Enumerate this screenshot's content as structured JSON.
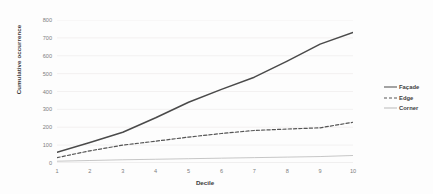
{
  "chart_data": {
    "type": "line",
    "title": "",
    "xlabel": "Decile",
    "ylabel": "Cumulative occurrence",
    "x": [
      1,
      2,
      3,
      4,
      5,
      6,
      7,
      8,
      9,
      10
    ],
    "xticklabels": [
      "1",
      "2",
      "3",
      "4",
      "5",
      "6",
      "7",
      "8",
      "9",
      "10"
    ],
    "yticks": [
      0,
      100,
      200,
      300,
      400,
      500,
      600,
      700,
      800
    ],
    "yticklabels": [
      "0",
      "100",
      "200",
      "300",
      "400",
      "500",
      "600",
      "700",
      "800"
    ],
    "xlim": [
      1,
      10
    ],
    "ylim": [
      0,
      800
    ],
    "grid": "horizontal",
    "legend_position": "right",
    "series": [
      {
        "name": "Façade",
        "style": "solid",
        "color": "#4a4a4a",
        "width": 1.5,
        "values": [
          60,
          115,
          172,
          253,
          340,
          412,
          480,
          570,
          665,
          730
        ]
      },
      {
        "name": "Edge",
        "style": "dashed",
        "color": "#555555",
        "width": 1.2,
        "values": [
          30,
          68,
          100,
          122,
          145,
          165,
          182,
          190,
          197,
          228
        ]
      },
      {
        "name": "Corner",
        "style": "solid",
        "color": "#b9b9b9",
        "width": 0.8,
        "values": [
          10,
          14,
          18,
          21,
          24,
          27,
          30,
          33,
          36,
          42
        ]
      }
    ]
  },
  "axes": {
    "y_title": "Cumulative occurrence",
    "x_title": "Decile"
  },
  "legend": {
    "items": [
      {
        "label": "Façade"
      },
      {
        "label": "Edge"
      },
      {
        "label": "Corner"
      }
    ]
  },
  "colors": {
    "background": "#fdfdfd",
    "gridline": "#eceaea",
    "axis": "#d8d6d6",
    "tick_text": "#7d7d7d",
    "title_text": "#3b3b3b",
    "facade": "#4a4a4a",
    "edge": "#555555",
    "corner": "#b9b9b9"
  }
}
